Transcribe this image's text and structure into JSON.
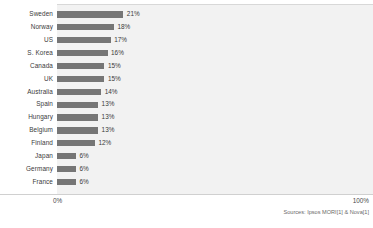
{
  "chart_data": {
    "type": "bar",
    "orientation": "horizontal",
    "title": "",
    "subtitle": "",
    "xlabel": "",
    "ylabel": "",
    "xlim": [
      0,
      100
    ],
    "grid": false,
    "legend": null,
    "value_suffix": "%",
    "categories": [
      "Sweden",
      "Norway",
      "US",
      "S. Korea",
      "Canada",
      "UK",
      "Australia",
      "Spain",
      "Hungary",
      "Belgium",
      "Finland",
      "Japan",
      "Germany",
      "France"
    ],
    "values": [
      21,
      18,
      17,
      16,
      15,
      15,
      14,
      13,
      13,
      13,
      12,
      6,
      6,
      6
    ],
    "data_labels": [
      "21%",
      "18%",
      "17%",
      "16%",
      "15%",
      "15%",
      "14%",
      "13%",
      "13%",
      "13%",
      "12%",
      "6%",
      "6%",
      "6%"
    ],
    "bars": [
      {
        "category": "Sweden",
        "value": 21,
        "label": "21%"
      },
      {
        "category": "Norway",
        "value": 18,
        "label": "18%"
      },
      {
        "category": "US",
        "value": 17,
        "label": "17%"
      },
      {
        "category": "S. Korea",
        "value": 16,
        "label": "16%"
      },
      {
        "category": "Canada",
        "value": 15,
        "label": "15%"
      },
      {
        "category": "UK",
        "value": 15,
        "label": "15%"
      },
      {
        "category": "Australia",
        "value": 14,
        "label": "14%"
      },
      {
        "category": "Spain",
        "value": 13,
        "label": "13%"
      },
      {
        "category": "Hungary",
        "value": 13,
        "label": "13%"
      },
      {
        "category": "Belgium",
        "value": 13,
        "label": "13%"
      },
      {
        "category": "Finland",
        "value": 12,
        "label": "12%"
      },
      {
        "category": "Japan",
        "value": 6,
        "label": "6%"
      },
      {
        "category": "Germany",
        "value": 6,
        "label": "6%"
      },
      {
        "category": "France",
        "value": 6,
        "label": "6%"
      }
    ],
    "axis": {
      "min_tick": "0%",
      "max_tick": "100%"
    },
    "colors": {
      "bar": "#767676",
      "plot_background": "#f2f2f2",
      "page_background": "#ffffff",
      "text": "#3a3a3a",
      "axis_line": "#d0d0d0",
      "source_text": "#6a6a6a"
    }
  },
  "footer": {
    "source": "Sources: Ipsos MORI[1] & Nova[1]"
  }
}
